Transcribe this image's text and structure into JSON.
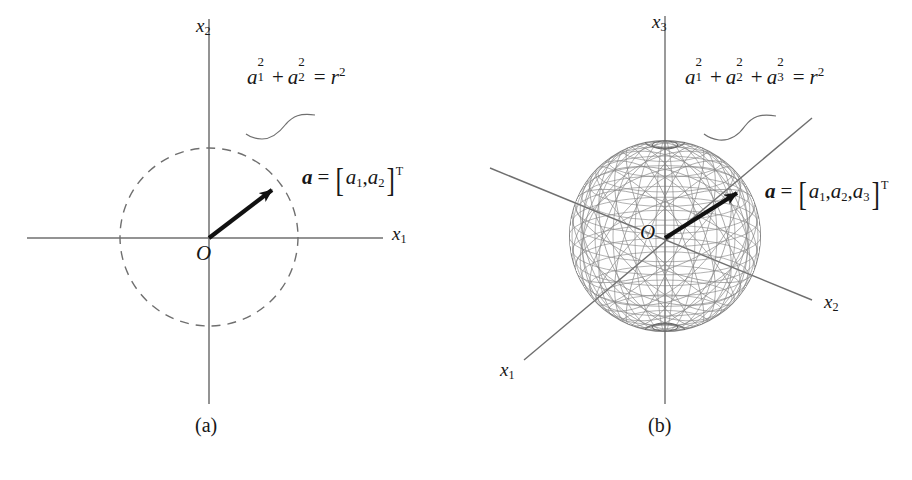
{
  "figure": {
    "background_color": "#ffffff",
    "ink_color": "#1a1a1a",
    "axis_color": "#6b6b6b",
    "mesh_color": "#7a7a7a",
    "vector_color": "#111111",
    "panels": [
      {
        "id": "panel-a",
        "caption": "(a)",
        "kind": "2d-circle",
        "origin_label": "O",
        "axes": [
          {
            "name": "x1",
            "label_base": "x",
            "label_sub": "1"
          },
          {
            "name": "x2",
            "label_base": "x",
            "label_sub": "2"
          }
        ],
        "equation": {
          "plain": "a1^2 + a2^2 = r^2",
          "terms": [
            {
              "base": "a",
              "sub": "1",
              "sup": "2"
            },
            {
              "op": "+"
            },
            {
              "base": "a",
              "sub": "2",
              "sup": "2"
            },
            {
              "op": "="
            },
            {
              "base": "r",
              "sup": "2"
            }
          ]
        },
        "vector_label": {
          "plain": "a = [a1, a2]^T",
          "symbol": "a",
          "equals": "=",
          "components": [
            "a",
            "a"
          ],
          "component_subs": [
            "1",
            "2"
          ],
          "separator": ",",
          "transpose": "T",
          "bracket_open": "[",
          "bracket_close": "]"
        },
        "geometry": {
          "circle_center": [
            209,
            237
          ],
          "circle_radius": 89,
          "circle_style": "dashed",
          "vector_tip": [
            272,
            190
          ],
          "x_axis_span": [
            27,
            383
          ],
          "y_axis_span": [
            19,
            404
          ]
        }
      },
      {
        "id": "panel-b",
        "caption": "(b)",
        "kind": "3d-sphere",
        "origin_label": "O",
        "axes": [
          {
            "name": "x1",
            "label_base": "x",
            "label_sub": "1"
          },
          {
            "name": "x2",
            "label_base": "x",
            "label_sub": "2"
          },
          {
            "name": "x3",
            "label_base": "x",
            "label_sub": "3"
          }
        ],
        "equation": {
          "plain": "a1^2 + a2^2 + a3^2 = r^2",
          "terms": [
            {
              "base": "a",
              "sub": "1",
              "sup": "2"
            },
            {
              "op": "+"
            },
            {
              "base": "a",
              "sub": "2",
              "sup": "2"
            },
            {
              "op": "+"
            },
            {
              "base": "a",
              "sub": "3",
              "sup": "2"
            },
            {
              "op": "="
            },
            {
              "base": "r",
              "sup": "2"
            }
          ]
        },
        "vector_label": {
          "plain": "a = [a1, a2, a3]^T",
          "symbol": "a",
          "equals": "=",
          "components": [
            "a",
            "a",
            "a"
          ],
          "component_subs": [
            "1",
            "2",
            "3"
          ],
          "separator": ",",
          "transpose": "T",
          "bracket_open": "[",
          "bracket_close": "]"
        },
        "geometry": {
          "sphere_center": [
            665,
            236
          ],
          "sphere_radius": 96,
          "sphere_style": "wireframe-mesh",
          "vector_tip": [
            737,
            192
          ],
          "x3_axis_span": [
            16,
            404
          ],
          "x1_axis_end": [
            524,
            360
          ],
          "x2_axis_end": [
            810,
            300
          ]
        }
      }
    ]
  },
  "labels": {
    "panel_a": {
      "axis_x1": "x",
      "axis_x1_sub": "1",
      "axis_x2": "x",
      "axis_x2_sub": "2",
      "origin": "O",
      "caption": "(a)"
    },
    "panel_b": {
      "axis_x1": "x",
      "axis_x1_sub": "1",
      "axis_x2": "x",
      "axis_x2_sub": "2",
      "axis_x3": "x",
      "axis_x3_sub": "3",
      "origin": "O",
      "caption": "(b)"
    },
    "symbols": {
      "a": "a",
      "r": "r",
      "two": "2",
      "three": "3",
      "one": "1",
      "plus": "+",
      "equals": "=",
      "comma": ",",
      "transpose": "T",
      "bracket_open": "[",
      "bracket_close": "]"
    }
  }
}
